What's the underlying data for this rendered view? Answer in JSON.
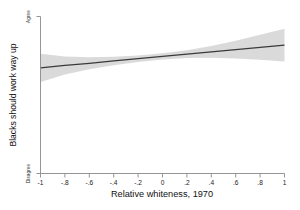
{
  "chart_data": {
    "type": "line",
    "title": "",
    "subtitle": "",
    "xlabel": "Relative whiteness, 1970",
    "ylabel": "Blacks should work way up",
    "xlim": [
      -1,
      1
    ],
    "ylim": [
      0,
      1
    ],
    "grid": false,
    "legend": null,
    "x_ticks": [
      -1,
      -0.8,
      -0.6,
      -0.4,
      -0.2,
      0,
      0.2,
      0.4,
      0.6,
      0.8,
      1
    ],
    "x_tick_labels": [
      "-1",
      "-.8",
      "-.6",
      "-.4",
      "-.2",
      "0",
      ".2",
      ".4",
      ".6",
      ".8",
      "1"
    ],
    "y_ticks": [
      1,
      0
    ],
    "y_tick_labels": [
      "Agree",
      "Disagree"
    ],
    "series": [
      {
        "name": "Linear prediction",
        "kind": "line",
        "color": "#3a3a3a",
        "x": [
          -1,
          -0.8,
          -0.6,
          -0.4,
          -0.2,
          0,
          0.2,
          0.4,
          0.6,
          0.8,
          1
        ],
        "values": [
          0.673,
          0.688,
          0.702,
          0.717,
          0.731,
          0.746,
          0.76,
          0.775,
          0.789,
          0.804,
          0.818
        ]
      },
      {
        "name": "95% confidence interval",
        "kind": "band",
        "color": "#d4d4d4",
        "x": [
          -1,
          -0.8,
          -0.6,
          -0.4,
          -0.2,
          0,
          0.2,
          0.4,
          0.6,
          0.8,
          1
        ],
        "lower": [
          0.583,
          0.631,
          0.664,
          0.69,
          0.71,
          0.726,
          0.735,
          0.738,
          0.733,
          0.725,
          0.714
        ],
        "upper": [
          0.763,
          0.745,
          0.74,
          0.744,
          0.752,
          0.766,
          0.785,
          0.812,
          0.845,
          0.883,
          0.922
        ]
      }
    ],
    "annotations": []
  },
  "axes": {
    "x_title": "Relative whiteness, 1970",
    "y_title": "Blacks should work way up",
    "y_top_label": "Agree",
    "y_bottom_label": "Disagree"
  },
  "ticks": {
    "x": [
      "-1",
      "-.8",
      "-.6",
      "-.4",
      "-.2",
      "0",
      ".2",
      ".4",
      ".6",
      ".8",
      "1"
    ]
  },
  "colors": {
    "line": "#3a3a3a",
    "band": "#d4d4d4",
    "axis": "#8a8a8a",
    "text": "#111111",
    "background": "#ffffff"
  }
}
